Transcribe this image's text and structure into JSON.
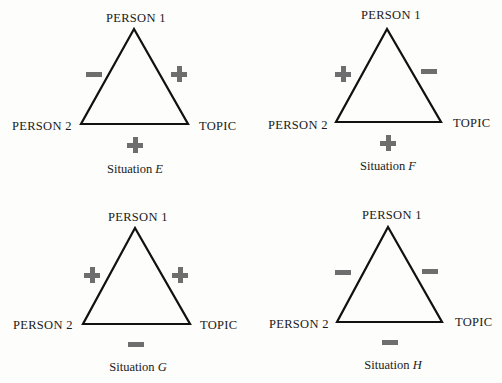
{
  "situations": [
    {
      "id": "E",
      "caption_prefix": "Situation",
      "caption_letter": "E",
      "vertices": {
        "top": "PERSON 1",
        "left": "PERSON 2",
        "right": "TOPIC"
      },
      "signs": {
        "person1_person2": "−",
        "person1_topic": "+",
        "person2_topic": "+"
      }
    },
    {
      "id": "F",
      "caption_prefix": "Situation",
      "caption_letter": "F",
      "vertices": {
        "top": "PERSON 1",
        "left": "PERSON 2",
        "right": "TOPIC"
      },
      "signs": {
        "person1_person2": "+",
        "person1_topic": "−",
        "person2_topic": "+"
      }
    },
    {
      "id": "G",
      "caption_prefix": "Situation",
      "caption_letter": "G",
      "vertices": {
        "top": "PERSON 1",
        "left": "PERSON 2",
        "right": "TOPIC"
      },
      "signs": {
        "person1_person2": "+",
        "person1_topic": "+",
        "person2_topic": "−"
      }
    },
    {
      "id": "H",
      "caption_prefix": "Situation",
      "caption_letter": "H",
      "vertices": {
        "top": "PERSON 1",
        "left": "PERSON 2",
        "right": "TOPIC"
      },
      "signs": {
        "person1_person2": "−",
        "person1_topic": "−",
        "person2_topic": "−"
      }
    }
  ],
  "colors": {
    "line": "#111111",
    "sign": "#6e6e6e",
    "background": "#fdfdfb"
  }
}
